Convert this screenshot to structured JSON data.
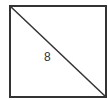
{
  "diagram": {
    "shape": "square",
    "diagonal": "top-left to bottom-right",
    "label": "8",
    "colors": {
      "stroke": "#333333",
      "background": "#ffffff"
    }
  }
}
